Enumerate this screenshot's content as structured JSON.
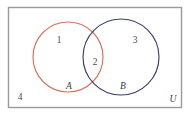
{
  "figure": {
    "type": "venn-diagram",
    "title": "",
    "universe": {
      "label": "U",
      "border_color": "#9a9a9a",
      "fill_color": "#ffffff",
      "x": 8,
      "y": 7,
      "width": 174,
      "height": 101
    },
    "sets": [
      {
        "id": "A",
        "label": "A",
        "color": "#d9705c",
        "cx": 68,
        "cy": 57,
        "r": 35,
        "label_x": 69,
        "label_y": 87
      },
      {
        "id": "B",
        "label": "B",
        "color": "#3a3f6b",
        "cx": 121,
        "cy": 57,
        "r": 38,
        "label_x": 123,
        "label_y": 87
      }
    ],
    "regions": [
      {
        "id": "a-only",
        "label": "1",
        "x": 59,
        "y": 41
      },
      {
        "id": "intersection",
        "label": "2",
        "x": 95,
        "y": 63
      },
      {
        "id": "b-only",
        "label": "3",
        "x": 135,
        "y": 41
      },
      {
        "id": "outside",
        "label": "4",
        "x": 20,
        "y": 98
      }
    ],
    "universe_label_position": {
      "x": 173,
      "y": 100
    }
  }
}
